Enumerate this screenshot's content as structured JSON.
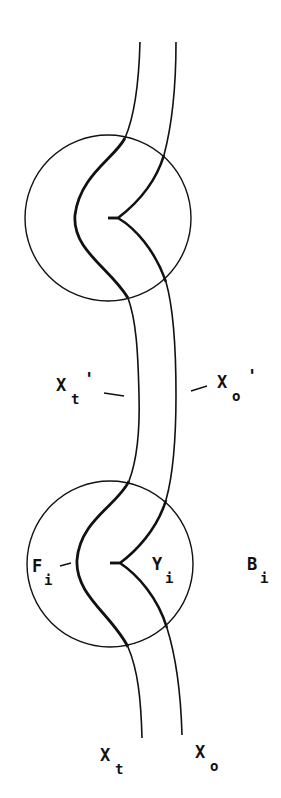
{
  "diagram": {
    "type": "knot-strand-diagram",
    "colors": {
      "stroke": "#111111",
      "background": "#ffffff"
    },
    "circles": [
      {
        "id": "upper-ball",
        "cx": 108,
        "cy": 218,
        "r": 83
      },
      {
        "id": "lower-ball",
        "cx": 110,
        "cy": 564,
        "r": 83
      }
    ],
    "strands": [
      {
        "id": "X_t",
        "role": "left strand (thick inside balls)"
      },
      {
        "id": "X_o",
        "role": "right strand with cusp"
      }
    ],
    "labels": {
      "xt_prime": {
        "main": "X",
        "sub": "t",
        "suffix": "'"
      },
      "xo_prime": {
        "main": "X",
        "sub": "o",
        "suffix": "'"
      },
      "fi": {
        "main": "F",
        "sub": "i"
      },
      "yi": {
        "main": "Y",
        "sub": "i"
      },
      "bi": {
        "main": "B",
        "sub": "i"
      },
      "xt": {
        "main": "X",
        "sub": "t"
      },
      "xo": {
        "main": "X",
        "sub": "o"
      }
    }
  }
}
